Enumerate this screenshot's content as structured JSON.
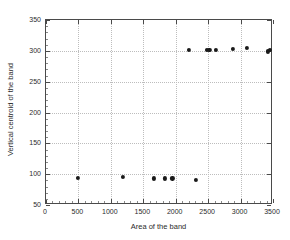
{
  "chart_data": {
    "type": "scatter",
    "title": "",
    "xlabel": "Area of the band",
    "ylabel": "Vertical centroid of the band",
    "xlim": [
      0,
      3500
    ],
    "ylim": [
      50,
      350
    ],
    "xticks": [
      0,
      500,
      1000,
      1500,
      2000,
      2500,
      3000,
      3500
    ],
    "xticklabels": [
      "0",
      "500",
      "1000",
      "1500",
      "2000",
      "2500",
      "3000",
      "3500"
    ],
    "yticks": [
      50,
      100,
      150,
      200,
      250,
      300,
      350
    ],
    "yticklabels": [
      "50",
      "100",
      "150",
      "200",
      "250",
      "300",
      "350"
    ],
    "grid": true,
    "grid_style": "dotted",
    "legend": null,
    "marker": "filled-circle",
    "marker_color": "#1a1a1a",
    "series": [
      {
        "name": "bands",
        "points": [
          [
            490,
            94
          ],
          [
            1190,
            95
          ],
          [
            1660,
            93
          ],
          [
            1830,
            93
          ],
          [
            1950,
            93
          ],
          [
            2310,
            91
          ],
          [
            2200,
            302
          ],
          [
            2480,
            301
          ],
          [
            2520,
            301
          ],
          [
            2620,
            301
          ],
          [
            2880,
            303
          ],
          [
            3100,
            305
          ],
          [
            3420,
            299
          ],
          [
            3450,
            302
          ]
        ]
      }
    ]
  },
  "axes": {
    "frame_color": "#4a4a4a",
    "grid_color": "#bdbdbd",
    "background": "#ffffff"
  }
}
